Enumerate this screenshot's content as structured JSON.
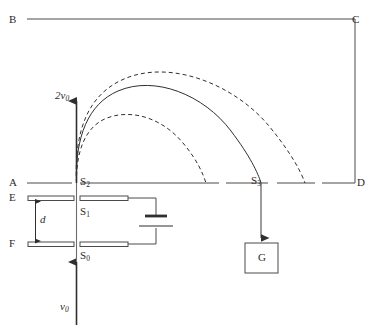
{
  "figure": {
    "stroke_color": "#3a3a3a",
    "text_color": "#2b2b2b",
    "background": "#ffffff",
    "width": 369,
    "height": 330
  },
  "corners": {
    "top_left": "B",
    "top_right": "C",
    "bottom_left": "A",
    "bottom_right": "D"
  },
  "plates": {
    "upper_left_label": "E",
    "lower_left_label": "F",
    "separation_label": "d"
  },
  "slits": {
    "s0": "S",
    "s0_sub": "0",
    "s1": "S",
    "s1_sub": "1",
    "s2": "S",
    "s2_sub": "2",
    "s3": "S",
    "s3_sub": "3"
  },
  "velocities": {
    "entry": "v",
    "entry_sub": "0",
    "exit": "2v",
    "exit_sub": "0"
  },
  "detector": {
    "label": "G"
  },
  "trajectories": [
    {
      "name": "inner-dashed-arc",
      "style": "dashed",
      "landing_x": 222
    },
    {
      "name": "middle-solid-arc",
      "style": "solid",
      "landing_x": 272
    },
    {
      "name": "outer-dashed-arc",
      "style": "dashed",
      "landing_x": 318
    }
  ]
}
